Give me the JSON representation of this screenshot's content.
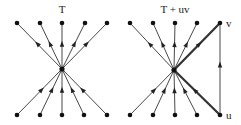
{
  "diagrams": [
    {
      "title": "T",
      "center": [
        62,
        69
      ],
      "top_nodes": [
        [
          17,
          23
        ],
        [
          40,
          23
        ],
        [
          62,
          23
        ],
        [
          85,
          23
        ],
        [
          107,
          23
        ]
      ],
      "bottom_nodes": [
        [
          17,
          115
        ],
        [
          40,
          115
        ],
        [
          62,
          115
        ],
        [
          84,
          115
        ],
        [
          107,
          115
        ]
      ]
    },
    {
      "title": "T + uv",
      "center": [
        174,
        70
      ],
      "top_nodes": [
        [
          130,
          23
        ],
        [
          153,
          23
        ],
        [
          175,
          23
        ],
        [
          197,
          23
        ],
        [
          220,
          23
        ]
      ],
      "bottom_nodes": [
        [
          130,
          115
        ],
        [
          153,
          115
        ],
        [
          175,
          115
        ],
        [
          197,
          115
        ],
        [
          220,
          115
        ]
      ],
      "labels": {
        "v": "v",
        "u": "u"
      },
      "highlight_edges": [
        "u-center",
        "center-v"
      ],
      "extra_edge": "u-v"
    }
  ],
  "colors": {
    "edge": "#333333",
    "node": "#111111",
    "background": "#ffffff"
  }
}
